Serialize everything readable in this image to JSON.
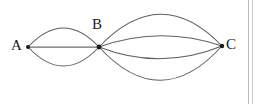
{
  "figure": {
    "kind": "multigraph-diagram",
    "background_color": "#ffffff",
    "edge_color": "#5f5f5f",
    "vertex_color": "#1a1a1a",
    "label_color": "#1a1a1a"
  },
  "vertices": [
    {
      "id": "A",
      "label": "A",
      "x": 28,
      "y": 47,
      "label_x": 11,
      "label_y": 38
    },
    {
      "id": "B",
      "label": "B",
      "x": 99,
      "y": 47,
      "label_x": 92,
      "label_y": 17
    },
    {
      "id": "C",
      "label": "C",
      "x": 222,
      "y": 46,
      "label_x": 226,
      "label_y": 37
    }
  ],
  "edges": [
    {
      "from": "A",
      "to": "B",
      "style": "arc-up",
      "peak_y": 28
    },
    {
      "from": "A",
      "to": "B",
      "style": "straight",
      "peak_y": 47
    },
    {
      "from": "A",
      "to": "B",
      "style": "arc-down",
      "peak_y": 66
    },
    {
      "from": "B",
      "to": "C",
      "style": "arc-up-outer",
      "peak_y": 15
    },
    {
      "from": "B",
      "to": "C",
      "style": "arc-up-inner",
      "peak_y": 36
    },
    {
      "from": "B",
      "to": "C",
      "style": "arc-down-inner",
      "peak_y": 59
    },
    {
      "from": "B",
      "to": "C",
      "style": "arc-down-outer",
      "peak_y": 80
    }
  ],
  "edge_counts": {
    "A_B": 3,
    "B_C": 4,
    "total": 7
  },
  "artifacts": [
    {
      "name": "scan-border-left",
      "x": 248,
      "color": "#b9b9b9"
    },
    {
      "name": "scan-border-right",
      "x": 252,
      "color": "#c9c9c9"
    }
  ]
}
